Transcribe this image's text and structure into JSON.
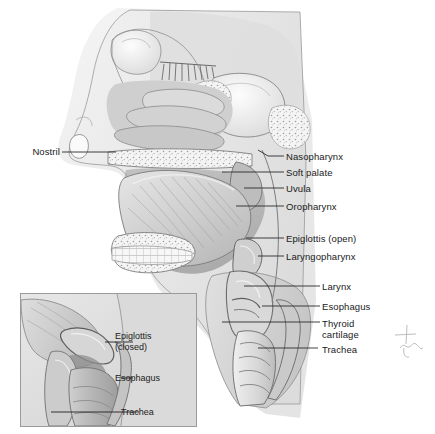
{
  "figure": {
    "kind": "anatomical-illustration",
    "style": "grayscale medical illustration",
    "background_color": "#ffffff",
    "label_color": "#1a1a1a",
    "leader_line_color": "#2a2a2a",
    "signature_present": true
  },
  "labels_left": [
    {
      "id": "nostril",
      "text": "Nostril"
    }
  ],
  "labels_right": [
    {
      "id": "nasopharynx",
      "text": "Nasopharynx"
    },
    {
      "id": "soft-palate",
      "text": "Soft palate"
    },
    {
      "id": "uvula",
      "text": "Uvula"
    },
    {
      "id": "oropharynx",
      "text": "Oropharynx"
    },
    {
      "id": "epiglottis-open",
      "text": "Epiglottis (open)"
    },
    {
      "id": "laryngopharynx",
      "text": "Laryngopharynx"
    },
    {
      "id": "larynx",
      "text": "Larynx"
    },
    {
      "id": "esophagus",
      "text": "Esophagus"
    },
    {
      "id": "thyroid-cartilage-1",
      "text": "Thyroid"
    },
    {
      "id": "thyroid-cartilage-2",
      "text": "cartilage"
    },
    {
      "id": "trachea",
      "text": "Trachea"
    }
  ],
  "inset": {
    "caption_state": "closed",
    "border_color": "#9a9a9a",
    "labels": [
      {
        "id": "inset-epiglottis-1",
        "text": "Epiglottis"
      },
      {
        "id": "inset-epiglottis-2",
        "text": "(closed)"
      },
      {
        "id": "inset-esophagus",
        "text": "Esophagus"
      },
      {
        "id": "inset-trachea",
        "text": "Trachea"
      }
    ]
  }
}
